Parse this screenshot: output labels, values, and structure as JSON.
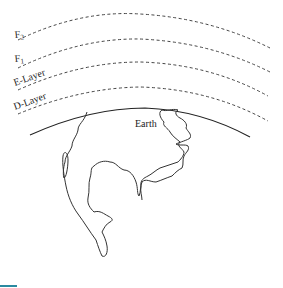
{
  "diagram": {
    "layers": [
      {
        "id": "f2",
        "label": "F",
        "subscript": "2"
      },
      {
        "id": "f1",
        "label": "F",
        "subscript": "1"
      },
      {
        "id": "e",
        "label": "E-Layer"
      },
      {
        "id": "d",
        "label": "D-Layer"
      }
    ],
    "earth_label": "Earth",
    "colors": {
      "line": "#444444",
      "accent": "#2a8aa0",
      "background": "#ffffff"
    }
  }
}
